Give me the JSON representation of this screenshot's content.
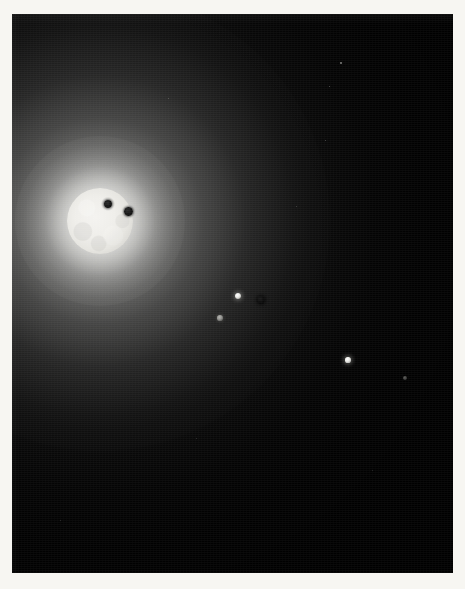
{
  "image": {
    "domain": "Natural-Image",
    "subject": "astronomical photograph of a bright star with transiting bodies",
    "caption": "Bright glowing stellar disk at upper left with two dark transiting bodies silhouetted against it, surrounded by a broad radial halo, with several smaller illuminated and dark bodies scattered across the right of the dark field.",
    "width": 465,
    "height": 589
  },
  "frame": {
    "border_color": "#f7f6f2",
    "border_left": 12,
    "border_top": 14,
    "content_width": 441,
    "content_height": 559
  },
  "background": {
    "color": "#000000",
    "glow_center_x": 100,
    "glow_center_y": 221,
    "glow_color": "#aaaaa8"
  },
  "star": {
    "name": "primary-star-disk",
    "center_x": 100,
    "center_y": 221,
    "radius": 33,
    "core_color": "#f4f3f0",
    "limb_color": "#a9a8a4",
    "halo_color": "#d7d7d4"
  },
  "transit_spots": [
    {
      "name": "transit-spot-1",
      "center_x": 108,
      "center_y": 204,
      "radius": 4.0,
      "color": "#161616"
    },
    {
      "name": "transit-spot-2",
      "center_x": 128,
      "center_y": 211,
      "radius": 4.5,
      "color": "#161616"
    }
  ],
  "bodies": [
    {
      "name": "body-bright-1",
      "center_x": 238,
      "center_y": 296,
      "radius": 3.4,
      "kind": "bright",
      "color": "#ffffff"
    },
    {
      "name": "body-dark-1",
      "center_x": 261,
      "center_y": 300,
      "radius": 3.6,
      "kind": "dark",
      "color": "#0b0b0b"
    },
    {
      "name": "body-dim-1",
      "center_x": 220,
      "center_y": 318,
      "radius": 2.6,
      "kind": "dim",
      "color": "#8f8f8c"
    },
    {
      "name": "body-bright-2",
      "center_x": 348,
      "center_y": 360,
      "radius": 2.6,
      "kind": "bright",
      "color": "#ebebe7"
    },
    {
      "name": "body-faint-1",
      "center_x": 405,
      "center_y": 378,
      "radius": 2.2,
      "kind": "faint",
      "color": "#4b4b49"
    }
  ],
  "field_stars": [
    {
      "name": "field-star-1",
      "x": 340,
      "y": 62,
      "size": 1.6,
      "opacity": 0.55
    },
    {
      "name": "field-star-2",
      "x": 329,
      "y": 86,
      "size": 1.4,
      "opacity": 0.4
    },
    {
      "name": "field-star-3",
      "x": 325,
      "y": 140,
      "size": 1.3,
      "opacity": 0.35
    },
    {
      "name": "field-star-4",
      "x": 168,
      "y": 98,
      "size": 1.2,
      "opacity": 0.3
    },
    {
      "name": "field-star-5",
      "x": 296,
      "y": 206,
      "size": 1.2,
      "opacity": 0.28
    },
    {
      "name": "field-star-6",
      "x": 196,
      "y": 438,
      "size": 1.2,
      "opacity": 0.22
    },
    {
      "name": "field-star-7",
      "x": 60,
      "y": 520,
      "size": 1.1,
      "opacity": 0.2
    },
    {
      "name": "field-star-8",
      "x": 372,
      "y": 470,
      "size": 1.1,
      "opacity": 0.18
    }
  ]
}
